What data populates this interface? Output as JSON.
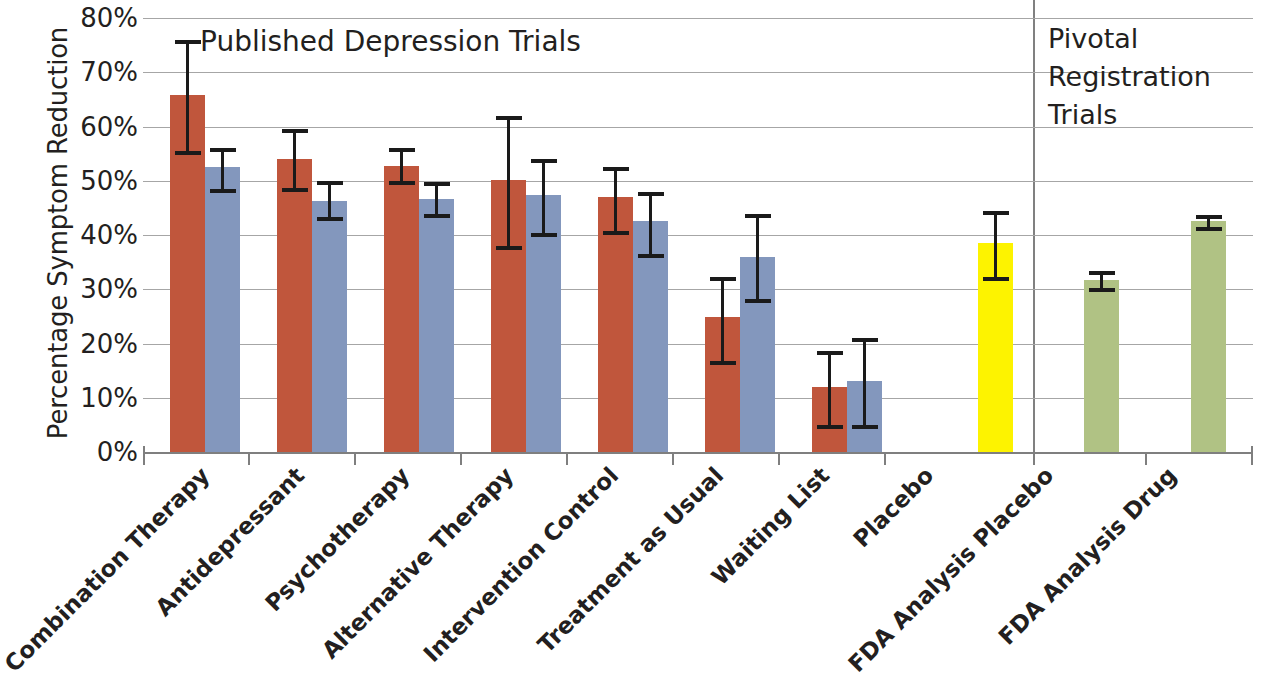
{
  "axis": {
    "y_title": "Percentage Symptom Reduction",
    "y_ticks": [
      "80%",
      "70%",
      "60%",
      "50%",
      "40%",
      "30%",
      "20%",
      "10%",
      "0%"
    ]
  },
  "headings": {
    "published": "Published Depression Trials",
    "pivotal_line1": "Pivotal",
    "pivotal_line2": "Registration",
    "pivotal_line3": "Trials"
  },
  "labels": {
    "l0": "Combination Therapy",
    "l1": "Antidepressant",
    "l2": "Psychotherapy",
    "l3": "Alternative Therapy",
    "l4": "Intervention Control",
    "l5": "Treatment as Usual",
    "l6": "Waiting List",
    "l7": "Placebo",
    "l8": "FDA Analysis Placebo",
    "l9": "FDA Analysis Drug"
  },
  "colors": {
    "red": "#c0563c",
    "blue": "#8397bd",
    "yellow": "#fdf300",
    "green": "#b0c284",
    "grid": "#a6a6a6",
    "axis": "#7f7f7f",
    "error": "#1a1a1a",
    "text": "#231f20"
  },
  "chart_data": {
    "type": "bar",
    "xlabel": "",
    "ylabel": "Percentage Symptom Reduction",
    "ylim": [
      0,
      80
    ],
    "ytick_values": [
      0,
      10,
      20,
      30,
      40,
      50,
      60,
      70,
      80
    ],
    "ytick_labels": [
      "0%",
      "10%",
      "20%",
      "30%",
      "40%",
      "50%",
      "60%",
      "70%",
      "80%"
    ],
    "grid": true,
    "legend": "none",
    "panels": [
      {
        "name": "Published Depression Trials",
        "categories": [
          "Combination Therapy",
          "Antidepressant",
          "Psychotherapy",
          "Alternative Therapy",
          "Intervention Control",
          "Treatment as Usual",
          "Waiting List",
          "Placebo"
        ]
      },
      {
        "name": "Pivotal Registration Trials",
        "categories": [
          "FDA Analysis Placebo",
          "FDA Analysis Drug"
        ]
      }
    ],
    "bars": [
      {
        "category": "Combination Therapy",
        "series": "red",
        "color": "#c0563c",
        "value": 65.8,
        "err_low": 55.5,
        "err_high": 76.0
      },
      {
        "category": "Combination Therapy",
        "series": "blue",
        "color": "#8397bd",
        "value": 52.5,
        "err_low": 48.5,
        "err_high": 56.0
      },
      {
        "category": "Antidepressant",
        "series": "red",
        "color": "#c0563c",
        "value": 54.0,
        "err_low": 48.6,
        "err_high": 59.5
      },
      {
        "category": "Antidepressant",
        "series": "blue",
        "color": "#8397bd",
        "value": 46.3,
        "err_low": 43.3,
        "err_high": 50.0
      },
      {
        "category": "Psychotherapy",
        "series": "red",
        "color": "#c0563c",
        "value": 52.8,
        "err_low": 50.0,
        "err_high": 56.0
      },
      {
        "category": "Psychotherapy",
        "series": "blue",
        "color": "#8397bd",
        "value": 46.7,
        "err_low": 43.8,
        "err_high": 49.8
      },
      {
        "category": "Alternative Therapy",
        "series": "red",
        "color": "#c0563c",
        "value": 50.2,
        "err_low": 38.0,
        "err_high": 62.0
      },
      {
        "category": "Alternative Therapy",
        "series": "blue",
        "color": "#8397bd",
        "value": 47.3,
        "err_low": 40.3,
        "err_high": 54.0
      },
      {
        "category": "Intervention Control",
        "series": "red",
        "color": "#c0563c",
        "value": 47.0,
        "err_low": 40.8,
        "err_high": 52.5
      },
      {
        "category": "Intervention Control",
        "series": "blue",
        "color": "#8397bd",
        "value": 42.5,
        "err_low": 36.5,
        "err_high": 48.0
      },
      {
        "category": "Treatment as Usual",
        "series": "red",
        "color": "#c0563c",
        "value": 24.8,
        "err_low": 16.8,
        "err_high": 32.3
      },
      {
        "category": "Treatment as Usual",
        "series": "blue",
        "color": "#8397bd",
        "value": 36.0,
        "err_low": 28.2,
        "err_high": 43.8
      },
      {
        "category": "Waiting List",
        "series": "red",
        "color": "#c0563c",
        "value": 11.9,
        "err_low": 5.0,
        "err_high": 18.7
      },
      {
        "category": "Waiting List",
        "series": "blue",
        "color": "#8397bd",
        "value": 13.0,
        "err_low": 5.0,
        "err_high": 21.0
      },
      {
        "category": "Placebo",
        "series": "yellow",
        "color": "#fdf300",
        "value": 38.5,
        "err_low": 32.2,
        "err_high": 44.5
      },
      {
        "category": "FDA Analysis Placebo",
        "series": "green",
        "color": "#b0c284",
        "value": 31.8,
        "err_low": 30.3,
        "err_high": 33.3
      },
      {
        "category": "FDA Analysis Drug",
        "series": "green",
        "color": "#b0c284",
        "value": 42.5,
        "err_low": 41.5,
        "err_high": 43.6
      }
    ]
  },
  "layout": {
    "bar_width": 35,
    "bar_x": [
      170,
      205,
      277,
      312,
      384,
      419,
      491,
      526,
      598,
      633,
      705,
      740,
      812,
      847,
      978,
      1084,
      1191
    ],
    "tick_x": [
      143,
      248,
      354,
      460,
      566,
      672,
      778,
      884,
      1033,
      1145,
      1251
    ],
    "plot_left": 143,
    "plot_top": 18,
    "plot_width": 1110,
    "plot_height": 434,
    "divider_x": 1033,
    "label_x": [
      196,
      291,
      396,
      500,
      605,
      710,
      816,
      920,
      1040,
      1163
    ]
  }
}
